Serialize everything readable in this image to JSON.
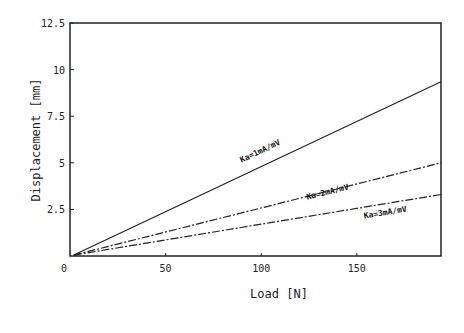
{
  "chart_data": {
    "type": "line",
    "title": "",
    "xlabel": "Load [N]",
    "ylabel": "Displacement [mm]",
    "xlim": [
      0,
      194
    ],
    "ylim": [
      0,
      12.5
    ],
    "xticks": [
      0,
      50,
      100,
      150
    ],
    "xtick_labels": [
      "0",
      "50",
      "100",
      "150"
    ],
    "yticks": [
      2.5,
      5,
      7.5,
      10,
      12.5
    ],
    "ytick_labels": [
      "2.5",
      "5",
      "7.5",
      "10",
      "12.5"
    ],
    "grid": false,
    "legend": "inline annotations",
    "series": [
      {
        "name": "Ka=1mA/mV",
        "x": [
          2,
          194
        ],
        "y": [
          0.05,
          9.35
        ],
        "style": "solid",
        "label_at": [
          100,
          5.5
        ]
      },
      {
        "name": "Ka=2mA/mV",
        "x": [
          2,
          194
        ],
        "y": [
          0.05,
          5.0
        ],
        "style": "dash-dot",
        "label_at": [
          135,
          3.3
        ]
      },
      {
        "name": "Ka=3mA/mV",
        "x": [
          2,
          194
        ],
        "y": [
          0.05,
          3.3
        ],
        "style": "dash-dot",
        "label_at": [
          165,
          2.2
        ]
      }
    ]
  }
}
